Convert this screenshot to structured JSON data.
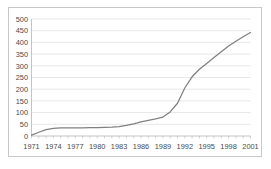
{
  "chart_data": {
    "type": "line",
    "title": "",
    "subtitle": "",
    "xlabel": "",
    "ylabel": "",
    "xlim": [
      1971,
      2001
    ],
    "ylim": [
      0,
      500
    ],
    "grid": true,
    "legend": null,
    "legend_position": "none",
    "line_color": "#808080",
    "grid_color": "#dcdcdc",
    "border_color": "#c9c9c9",
    "axis_color": "#b5b5b5",
    "ytick_labels": [
      "0",
      "50",
      "100",
      "150",
      "200",
      "250",
      "300",
      "350",
      "400",
      "450",
      "500"
    ],
    "ytick_values": [
      0,
      50,
      100,
      150,
      200,
      250,
      300,
      350,
      400,
      450,
      500
    ],
    "xtick_labels": [
      "1971",
      "1974",
      "1977",
      "1980",
      "1983",
      "1986",
      "1989",
      "1992",
      "1995",
      "1998",
      "2001"
    ],
    "xtick_values": [
      1971,
      1974,
      1977,
      1980,
      1983,
      1986,
      1989,
      1992,
      1995,
      1998,
      2001
    ],
    "x": [
      1971,
      1972,
      1973,
      1974,
      1975,
      1976,
      1977,
      1978,
      1979,
      1980,
      1981,
      1982,
      1983,
      1984,
      1985,
      1986,
      1987,
      1988,
      1989,
      1990,
      1991,
      1992,
      1993,
      1994,
      1995,
      1996,
      1997,
      1998,
      1999,
      2000,
      2001
    ],
    "values": [
      4,
      16,
      27,
      33,
      35,
      35,
      35,
      35,
      36,
      36,
      37,
      38,
      40,
      45,
      52,
      60,
      67,
      73,
      81,
      103,
      140,
      205,
      253,
      285,
      310,
      335,
      360,
      385,
      405,
      424,
      442
    ]
  }
}
